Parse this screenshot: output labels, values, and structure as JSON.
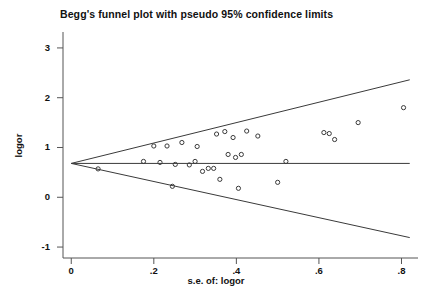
{
  "chart_data": {
    "type": "scatter",
    "title": "Begg's funnel plot with pseudo 95% confidence limits",
    "xlabel": "s.e. of: logor",
    "ylabel": "logor",
    "xlim": [
      -0.02,
      0.84
    ],
    "ylim": [
      -1.22,
      3.32
    ],
    "xticks": [
      0,
      0.2,
      0.4,
      0.6,
      0.8
    ],
    "xticklabels": [
      "0",
      ".2",
      ".4",
      ".6",
      ".8"
    ],
    "yticks": [
      -1,
      0,
      1,
      2,
      3
    ],
    "yticklabels": [
      "-1",
      "0",
      "1",
      "2",
      "3"
    ],
    "grid": false,
    "legend": false,
    "marker": "open-circle",
    "marker_size_px": 4,
    "line_color": "#3a3a3a",
    "marker_color": "#3a3a3a",
    "pooled_estimate": 0.68,
    "center_line": {
      "name": "pooled effect",
      "y": 0.68,
      "x_from": 0,
      "x_to": 0.82
    },
    "ci_upper": {
      "name": "pseudo 95% upper limit",
      "points": [
        [
          0,
          0.68
        ],
        [
          0.82,
          2.36
        ]
      ]
    },
    "ci_lower": {
      "name": "pseudo 95% lower limit",
      "points": [
        [
          0,
          0.68
        ],
        [
          0.82,
          -0.81
        ]
      ]
    },
    "series": [
      {
        "name": "studies",
        "points": [
          [
            0.065,
            0.57
          ],
          [
            0.175,
            0.72
          ],
          [
            0.2,
            1.03
          ],
          [
            0.215,
            0.7
          ],
          [
            0.232,
            1.03
          ],
          [
            0.245,
            0.22
          ],
          [
            0.252,
            0.66
          ],
          [
            0.268,
            1.1
          ],
          [
            0.286,
            0.65
          ],
          [
            0.3,
            0.72
          ],
          [
            0.305,
            1.02
          ],
          [
            0.318,
            0.52
          ],
          [
            0.332,
            0.58
          ],
          [
            0.345,
            0.58
          ],
          [
            0.352,
            1.27
          ],
          [
            0.36,
            0.36
          ],
          [
            0.372,
            1.32
          ],
          [
            0.38,
            0.86
          ],
          [
            0.392,
            1.2
          ],
          [
            0.398,
            0.8
          ],
          [
            0.405,
            0.18
          ],
          [
            0.412,
            0.86
          ],
          [
            0.425,
            1.33
          ],
          [
            0.452,
            1.23
          ],
          [
            0.5,
            0.3
          ],
          [
            0.52,
            0.72
          ],
          [
            0.612,
            1.3
          ],
          [
            0.625,
            1.28
          ],
          [
            0.638,
            1.16
          ],
          [
            0.695,
            1.5
          ],
          [
            0.805,
            1.8
          ]
        ]
      }
    ]
  }
}
